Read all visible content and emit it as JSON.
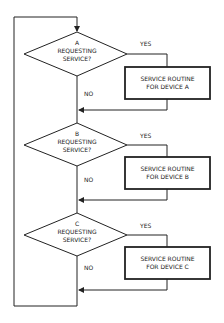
{
  "diagram": {
    "type": "flowchart",
    "stroke_color": "#222222",
    "decisions": [
      {
        "device": "A",
        "line1": "A",
        "line2": "REQUESTING",
        "line3": "SERVICE?",
        "yes_label": "YES",
        "no_label": "NO",
        "routine_line1": "SERVICE ROUTINE",
        "routine_line2": "FOR DEVICE A"
      },
      {
        "device": "B",
        "line1": "B",
        "line2": "REQUESTING",
        "line3": "SERVICE?",
        "yes_label": "YES",
        "no_label": "NO",
        "routine_line1": "SERVICE ROUTINE",
        "routine_line2": "FOR DEVICE B"
      },
      {
        "device": "C",
        "line1": "C",
        "line2": "REQUESTING",
        "line3": "SERVICE?",
        "yes_label": "YES",
        "no_label": "NO",
        "routine_line1": "SERVICE ROUTINE",
        "routine_line2": "FOR DEVICE C"
      }
    ]
  }
}
